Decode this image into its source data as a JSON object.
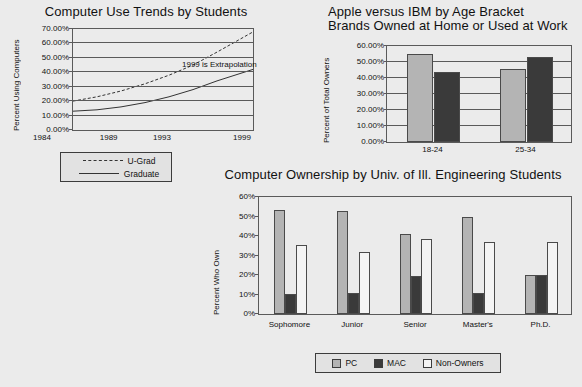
{
  "page": {
    "background_color": "#ebebeb",
    "axis_color": "#5a5a5a",
    "text_color": "#111111"
  },
  "chart_data": [
    {
      "id": "computer-use-trends",
      "type": "line",
      "title": "Computer Use Trends by Students",
      "xlabel": "",
      "ylabel": "Percent Using Computers",
      "ylim": [
        0,
        70
      ],
      "yticks": [
        "0.00%",
        "10.00%",
        "20.00%",
        "30.00%",
        "40.00%",
        "50.00%",
        "60.00%",
        "70.00%"
      ],
      "ytick_values": [
        0,
        10,
        20,
        30,
        40,
        50,
        60,
        70
      ],
      "xticks": [
        "1984",
        "1989",
        "1993",
        "1999"
      ],
      "xtick_values": [
        1984,
        1989,
        1993,
        1999
      ],
      "xlim": [
        1984,
        1999
      ],
      "grid": true,
      "legend_position": "below-left",
      "annotations": [
        {
          "text": "1999 is Extrapolation",
          "x": 1994,
          "y": 45
        }
      ],
      "series": [
        {
          "name": "U-Grad",
          "style": "dashed",
          "x": [
            1984,
            1986,
            1988,
            1990,
            1992,
            1994,
            1996,
            1999
          ],
          "values": [
            20,
            23,
            27,
            32,
            38,
            45,
            54,
            68
          ]
        },
        {
          "name": "Graduate",
          "style": "solid",
          "x": [
            1984,
            1986,
            1988,
            1990,
            1992,
            1994,
            1996,
            1999
          ],
          "values": [
            13,
            14,
            16,
            19,
            23,
            28,
            34,
            42
          ]
        }
      ]
    },
    {
      "id": "apple-versus-ibm",
      "type": "bar",
      "title_line1": "Apple versus IBM by Age Bracket",
      "title_line2": "Brands Owned at Home or Used at Work",
      "xlabel": "",
      "ylabel": "Percent of Total Owners",
      "ylim": [
        0,
        60
      ],
      "yticks": [
        "0.00%",
        "10.00%",
        "20.00%",
        "30.00%",
        "40.00%",
        "50.00%",
        "60.00%"
      ],
      "ytick_values": [
        0,
        10,
        20,
        30,
        40,
        50,
        60
      ],
      "categories": [
        "18-24",
        "25-34"
      ],
      "grid": true,
      "legend_position": "none",
      "series": [
        {
          "name": "Apple",
          "color": "#b4b4b4",
          "values": [
            55.0,
            45.5
          ]
        },
        {
          "name": "IBM",
          "color": "#3a3a3a",
          "values": [
            44.0,
            53.0
          ]
        }
      ]
    },
    {
      "id": "computer-ownership-engineering",
      "type": "bar",
      "title": "Computer Ownership by Univ. of Ill. Engineering Students",
      "xlabel": "",
      "ylabel": "Percent Who Own",
      "ylim": [
        0,
        60
      ],
      "yticks": [
        "0%",
        "10%",
        "20%",
        "30%",
        "40%",
        "50%",
        "60%"
      ],
      "ytick_values": [
        0,
        10,
        20,
        30,
        40,
        50,
        60
      ],
      "categories": [
        "Sophomore",
        "Junior",
        "Senior",
        "Master's",
        "Ph.D."
      ],
      "grid": false,
      "legend_position": "bottom",
      "series": [
        {
          "name": "PC",
          "color": "#b4b4b4",
          "values": [
            53.5,
            53.0,
            41.0,
            49.5,
            20.0
          ]
        },
        {
          "name": "MAC",
          "color": "#3a3a3a",
          "values": [
            10.5,
            11.0,
            19.5,
            11.0,
            20.0
          ]
        },
        {
          "name": "Non-Owners",
          "color": "#f4f4f4",
          "values": [
            35.5,
            32.0,
            38.5,
            37.0,
            37.0
          ]
        }
      ]
    }
  ]
}
